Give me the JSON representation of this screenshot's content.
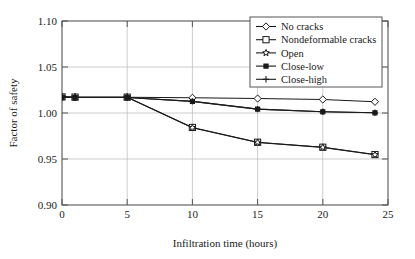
{
  "chart_data": {
    "type": "line",
    "title": "",
    "xlabel": "Infiltration time (hours)",
    "ylabel": "Factor of safety",
    "xlim": [
      0,
      25
    ],
    "ylim": [
      0.9,
      1.1
    ],
    "xticks": [
      "0",
      "5",
      "10",
      "15",
      "20",
      "25"
    ],
    "xtick_values": [
      0,
      5,
      10,
      15,
      20,
      25
    ],
    "yticks": [
      "0.90",
      "0.95",
      "1.00",
      "1.05",
      "1.10"
    ],
    "ytick_values": [
      0.9,
      0.95,
      1.0,
      1.05,
      1.1
    ],
    "grid": true,
    "legend_position": "top-right",
    "x": [
      0,
      1,
      5,
      10,
      15,
      20,
      24
    ],
    "series": [
      {
        "name": "No cracks",
        "marker": "diamond-open",
        "values": [
          1.0175,
          1.0172,
          1.0172,
          1.0165,
          1.0157,
          1.0147,
          1.0122
        ]
      },
      {
        "name": "Nondeformable cracks",
        "marker": "square-open",
        "values": [
          1.0175,
          1.0172,
          1.0172,
          0.9843,
          0.9682,
          0.9628,
          0.9548
        ]
      },
      {
        "name": "Open",
        "marker": "star-open",
        "values": [
          1.0175,
          1.0172,
          1.0172,
          0.984,
          0.968,
          0.9626,
          0.9546
        ]
      },
      {
        "name": "Close-low",
        "marker": "square-solid",
        "values": [
          1.0172,
          1.0168,
          1.0168,
          1.0126,
          1.0042,
          1.0013,
          1.0002
        ]
      },
      {
        "name": "Close-high",
        "marker": "plus",
        "values": [
          1.0172,
          1.0168,
          1.0168,
          1.0126,
          1.0042,
          1.0013,
          1.0002
        ]
      }
    ]
  }
}
